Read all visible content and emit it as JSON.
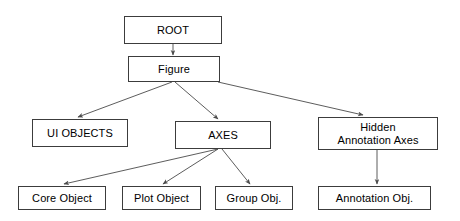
{
  "diagram": {
    "background_color": "#ffffff",
    "box_border_color": "#3c3c3c",
    "edge_color": "#4a4a4a",
    "text_color": "#000000",
    "nodes": [
      {
        "id": "root",
        "label": "ROOT",
        "x": 124,
        "y": 16,
        "w": 98,
        "h": 28
      },
      {
        "id": "figure",
        "label": "Figure",
        "x": 128,
        "y": 56,
        "w": 92,
        "h": 26
      },
      {
        "id": "ui_objects",
        "label": "UI OBJECTS",
        "x": 32,
        "y": 119,
        "w": 96,
        "h": 28
      },
      {
        "id": "axes",
        "label": "AXES",
        "x": 175,
        "y": 121,
        "w": 96,
        "h": 28
      },
      {
        "id": "hidden_axes",
        "label": "Hidden\nAnnotation Axes",
        "x": 318,
        "y": 117,
        "w": 120,
        "h": 33
      },
      {
        "id": "core_object",
        "label": "Core Object",
        "x": 18,
        "y": 186,
        "w": 88,
        "h": 24
      },
      {
        "id": "plot_object",
        "label": "Plot Object",
        "x": 122,
        "y": 186,
        "w": 79,
        "h": 24
      },
      {
        "id": "group_object",
        "label": "Group Obj.",
        "x": 215,
        "y": 186,
        "w": 78,
        "h": 24
      },
      {
        "id": "annotation_object",
        "label": "Annotation Obj.",
        "x": 318,
        "y": 186,
        "w": 113,
        "h": 24
      }
    ],
    "edges": [
      {
        "id": "root-to-figure",
        "from": "root",
        "to": "figure",
        "x1": 173,
        "y1": 44,
        "x2": 173,
        "y2": 55
      },
      {
        "id": "figure-to-ui-objects",
        "from": "figure",
        "to": "ui_objects",
        "x1": 172,
        "y1": 82,
        "x2": 78,
        "y2": 117
      },
      {
        "id": "figure-to-axes",
        "from": "figure",
        "to": "axes",
        "x1": 175,
        "y1": 82,
        "x2": 218,
        "y2": 119
      },
      {
        "id": "figure-to-hidden-axes",
        "from": "figure",
        "to": "hidden_axes",
        "x1": 218,
        "y1": 82,
        "x2": 363,
        "y2": 115
      },
      {
        "id": "axes-to-core-object",
        "from": "axes",
        "to": "core_object",
        "x1": 218,
        "y1": 149,
        "x2": 64,
        "y2": 184
      },
      {
        "id": "axes-to-plot-object",
        "from": "axes",
        "to": "plot_object",
        "x1": 218,
        "y1": 149,
        "x2": 163,
        "y2": 184
      },
      {
        "id": "axes-to-group-object",
        "from": "axes",
        "to": "group_object",
        "x1": 222,
        "y1": 149,
        "x2": 250,
        "y2": 184
      },
      {
        "id": "hidden-axes-to-annotation",
        "from": "hidden_axes",
        "to": "annotation_object",
        "x1": 377,
        "y1": 150,
        "x2": 377,
        "y2": 184
      }
    ]
  }
}
